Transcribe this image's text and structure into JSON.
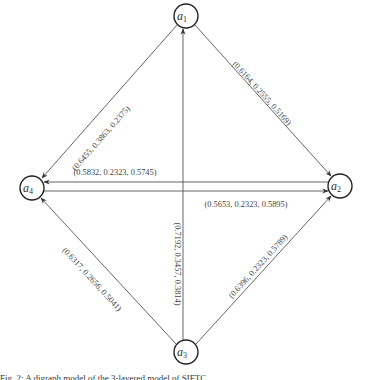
{
  "diagram": {
    "type": "directed-graph",
    "nodes": [
      {
        "id": "a1",
        "base": "a",
        "sub": "1",
        "cx": 186,
        "cy": 16
      },
      {
        "id": "a2",
        "base": "a",
        "sub": "2",
        "cx": 340,
        "cy": 186
      },
      {
        "id": "a3",
        "base": "a",
        "sub": "3",
        "cx": 186,
        "cy": 352
      },
      {
        "id": "a4",
        "base": "a",
        "sub": "4",
        "cx": 32,
        "cy": 188
      }
    ],
    "edges": [
      {
        "from": "a1",
        "to": "a4",
        "label": "(0.6455, 0.3863, 0.2375)"
      },
      {
        "from": "a1",
        "to": "a2",
        "label": "(0.6164, 0.2555, 0.5169)"
      },
      {
        "from": "a2",
        "to": "a4",
        "label": "(0.5832, 0.2323, 0.5745)"
      },
      {
        "from": "a4",
        "to": "a2",
        "label": "(0.5653, 0.2323, 0.5895)"
      },
      {
        "from": "a3",
        "to": "a1",
        "label": "(0.7192, 0.3457, 0.3814)"
      },
      {
        "from": "a3",
        "to": "a4",
        "label": "(0.6317, 0.2656, 0.5041)"
      },
      {
        "from": "a3",
        "to": "a2",
        "label": "(0.6396, 0.2323, 0.5789)"
      }
    ]
  },
  "caption": "Fig. 2: A digraph model of the 3-layered model of SIFTC"
}
